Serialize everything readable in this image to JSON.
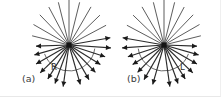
{
  "figure": {
    "background": "#ffffff",
    "width": 221,
    "height": 97,
    "ray_color": "#4a4a4a",
    "arrow_color": "#1a1a1a",
    "hub_color": "#141414",
    "arc_color": "#5a5a5a"
  },
  "panels": [
    {
      "id": "a",
      "label": "(a)",
      "label_x": 22,
      "label_y": 82,
      "hub_x": 69,
      "hub_y": 45,
      "hub_size": 5,
      "mirrored": false,
      "radius_label": "R",
      "radius_label_x": 51,
      "radius_label_y": 70,
      "arc_radius": 26,
      "arc_start_deg": 200,
      "arc_end_deg": 352,
      "rays": [
        {
          "angle_deg": 262,
          "length": 42,
          "arrow": true,
          "weight": "bold"
        },
        {
          "angle_deg": 250,
          "length": 41,
          "arrow": true,
          "weight": "bold"
        },
        {
          "angle_deg": 238,
          "length": 40,
          "arrow": true,
          "weight": "bold"
        },
        {
          "angle_deg": 224,
          "length": 40,
          "arrow": true,
          "weight": "bold"
        },
        {
          "angle_deg": 210,
          "length": 38,
          "arrow": true,
          "weight": "bold"
        },
        {
          "angle_deg": 196,
          "length": 36,
          "arrow": true,
          "weight": "bold"
        },
        {
          "angle_deg": 182,
          "length": 33,
          "arrow": true,
          "weight": "bold"
        },
        {
          "angle_deg": 286,
          "length": 41,
          "arrow": true,
          "weight": "bold"
        },
        {
          "angle_deg": 300,
          "length": 40,
          "arrow": true,
          "weight": "bold"
        },
        {
          "angle_deg": 314,
          "length": 38,
          "arrow": true,
          "weight": "bold"
        },
        {
          "angle_deg": 328,
          "length": 37,
          "arrow": true,
          "weight": "bold"
        },
        {
          "angle_deg": 342,
          "length": 38,
          "arrow": true,
          "weight": "bold"
        },
        {
          "angle_deg": 356,
          "length": 42,
          "arrow": true,
          "weight": "bold"
        },
        {
          "angle_deg": 10,
          "length": 42,
          "arrow": true,
          "weight": "bold"
        },
        {
          "angle_deg": 28,
          "length": 42,
          "arrow": false,
          "weight": "thin"
        },
        {
          "angle_deg": 44,
          "length": 43,
          "arrow": false,
          "weight": "thin"
        },
        {
          "angle_deg": 60,
          "length": 44,
          "arrow": false,
          "weight": "thin"
        },
        {
          "angle_deg": 76,
          "length": 44,
          "arrow": false,
          "weight": "thin"
        },
        {
          "angle_deg": 90,
          "length": 45,
          "arrow": false,
          "weight": "thin"
        },
        {
          "angle_deg": 104,
          "length": 44,
          "arrow": false,
          "weight": "thin"
        },
        {
          "angle_deg": 118,
          "length": 43,
          "arrow": false,
          "weight": "thin"
        },
        {
          "angle_deg": 134,
          "length": 42,
          "arrow": false,
          "weight": "thin"
        },
        {
          "angle_deg": 150,
          "length": 41,
          "arrow": false,
          "weight": "thin"
        },
        {
          "angle_deg": 166,
          "length": 38,
          "arrow": false,
          "weight": "thin"
        }
      ]
    },
    {
      "id": "b",
      "label": "(b)",
      "label_x": 127,
      "label_y": 82,
      "hub_x": 164,
      "hub_y": 45,
      "hub_size": 5,
      "mirrored": true,
      "radius_label": "L",
      "radius_label_x": 180,
      "radius_label_y": 70,
      "arc_radius": 26,
      "arc_start_deg": 188,
      "arc_end_deg": 340,
      "rays": [
        {
          "angle_deg": 278,
          "length": 42,
          "arrow": true,
          "weight": "bold"
        },
        {
          "angle_deg": 290,
          "length": 41,
          "arrow": true,
          "weight": "bold"
        },
        {
          "angle_deg": 302,
          "length": 40,
          "arrow": true,
          "weight": "bold"
        },
        {
          "angle_deg": 316,
          "length": 40,
          "arrow": true,
          "weight": "bold"
        },
        {
          "angle_deg": 330,
          "length": 38,
          "arrow": true,
          "weight": "bold"
        },
        {
          "angle_deg": 344,
          "length": 36,
          "arrow": true,
          "weight": "bold"
        },
        {
          "angle_deg": 358,
          "length": 33,
          "arrow": true,
          "weight": "bold"
        },
        {
          "angle_deg": 254,
          "length": 41,
          "arrow": true,
          "weight": "bold"
        },
        {
          "angle_deg": 240,
          "length": 40,
          "arrow": true,
          "weight": "bold"
        },
        {
          "angle_deg": 226,
          "length": 38,
          "arrow": true,
          "weight": "bold"
        },
        {
          "angle_deg": 212,
          "length": 37,
          "arrow": true,
          "weight": "bold"
        },
        {
          "angle_deg": 198,
          "length": 38,
          "arrow": true,
          "weight": "bold"
        },
        {
          "angle_deg": 184,
          "length": 42,
          "arrow": true,
          "weight": "bold"
        },
        {
          "angle_deg": 170,
          "length": 42,
          "arrow": true,
          "weight": "bold"
        },
        {
          "angle_deg": 152,
          "length": 42,
          "arrow": false,
          "weight": "thin"
        },
        {
          "angle_deg": 136,
          "length": 43,
          "arrow": false,
          "weight": "thin"
        },
        {
          "angle_deg": 120,
          "length": 44,
          "arrow": false,
          "weight": "thin"
        },
        {
          "angle_deg": 104,
          "length": 44,
          "arrow": false,
          "weight": "thin"
        },
        {
          "angle_deg": 90,
          "length": 45,
          "arrow": false,
          "weight": "thin"
        },
        {
          "angle_deg": 76,
          "length": 44,
          "arrow": false,
          "weight": "thin"
        },
        {
          "angle_deg": 62,
          "length": 43,
          "arrow": false,
          "weight": "thin"
        },
        {
          "angle_deg": 46,
          "length": 42,
          "arrow": false,
          "weight": "thin"
        },
        {
          "angle_deg": 30,
          "length": 41,
          "arrow": false,
          "weight": "thin"
        },
        {
          "angle_deg": 14,
          "length": 38,
          "arrow": false,
          "weight": "thin"
        }
      ]
    }
  ]
}
